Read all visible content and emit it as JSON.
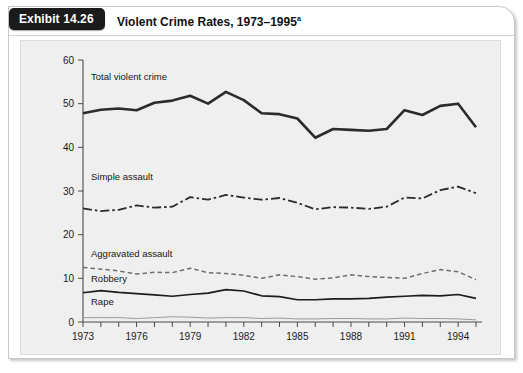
{
  "exhibit": {
    "tab_label": "Exhibit 14.26",
    "title": "Violent Crime Rates, 1973–1995",
    "title_superscript": "a"
  },
  "chart_data": {
    "type": "line",
    "title": "Violent Crime Rates, 1973–1995",
    "xlabel": "",
    "ylabel": "",
    "xlim": [
      1973,
      1995
    ],
    "ylim": [
      0,
      60
    ],
    "ytick_values": [
      0,
      10,
      20,
      30,
      40,
      50,
      60
    ],
    "ytick_labels": [
      "0",
      "10",
      "20",
      "30",
      "40",
      "50",
      "60"
    ],
    "xtick_values": [
      1973,
      1974,
      1975,
      1976,
      1977,
      1978,
      1979,
      1980,
      1981,
      1982,
      1983,
      1984,
      1985,
      1986,
      1987,
      1988,
      1989,
      1990,
      1991,
      1992,
      1993,
      1994,
      1995
    ],
    "xtick_labels_shown": [
      "1973",
      "1976",
      "1979",
      "1982",
      "1985",
      "1988",
      "1991",
      "1994"
    ],
    "xtick_label_values": [
      1973,
      1976,
      1979,
      1982,
      1985,
      1988,
      1991,
      1994
    ],
    "grid": false,
    "legend": "inline-labels",
    "x": [
      1973,
      1974,
      1975,
      1976,
      1977,
      1978,
      1979,
      1980,
      1981,
      1982,
      1983,
      1984,
      1985,
      1986,
      1987,
      1988,
      1989,
      1990,
      1991,
      1992,
      1993,
      1994,
      1995
    ],
    "series": [
      {
        "name": "Total violent crime",
        "label": "Total violent crime",
        "style": "solid-thick",
        "color": "#2b2b2b",
        "values": [
          47.8,
          48.6,
          48.9,
          48.5,
          50.2,
          50.7,
          51.8,
          50.0,
          52.7,
          50.8,
          47.8,
          47.6,
          46.6,
          42.2,
          44.2,
          44.0,
          43.8,
          44.2,
          48.5,
          47.4,
          49.5,
          50.0,
          44.6
        ]
      },
      {
        "name": "Simple assault",
        "label": "Simple assault",
        "style": "dash-dot",
        "color": "#2b2b2b",
        "values": [
          26.0,
          25.4,
          25.7,
          26.7,
          26.2,
          26.4,
          28.6,
          28.0,
          29.1,
          28.5,
          28.0,
          28.4,
          27.3,
          25.8,
          26.3,
          26.2,
          25.9,
          26.4,
          28.5,
          28.3,
          30.2,
          31.0,
          29.5
        ]
      },
      {
        "name": "Aggravated assault",
        "label": "Aggravated assault",
        "style": "dashed-thin",
        "color": "#6e6e6e",
        "values": [
          12.5,
          12.1,
          11.7,
          11.0,
          11.4,
          11.3,
          12.3,
          11.3,
          11.1,
          10.7,
          10.0,
          10.8,
          10.4,
          9.8,
          10.1,
          10.8,
          10.4,
          10.2,
          10.0,
          11.1,
          12.0,
          11.5,
          9.7
        ]
      },
      {
        "name": "Robbery",
        "label": "Robbery",
        "style": "solid-medium",
        "color": "#1c1c1c",
        "values": [
          6.7,
          7.2,
          6.8,
          6.5,
          6.2,
          5.9,
          6.3,
          6.6,
          7.4,
          7.1,
          6.0,
          5.8,
          5.1,
          5.1,
          5.3,
          5.3,
          5.4,
          5.7,
          5.9,
          6.1,
          6.0,
          6.3,
          5.4
        ]
      },
      {
        "name": "Rape",
        "label": "Rape",
        "style": "solid-thin",
        "color": "#9a9a9a",
        "values": [
          1.0,
          1.0,
          1.0,
          0.8,
          1.0,
          1.2,
          1.1,
          0.9,
          1.0,
          1.0,
          0.8,
          0.9,
          0.7,
          0.7,
          0.8,
          0.8,
          0.7,
          0.7,
          0.9,
          0.8,
          0.8,
          0.7,
          0.5
        ]
      }
    ]
  }
}
